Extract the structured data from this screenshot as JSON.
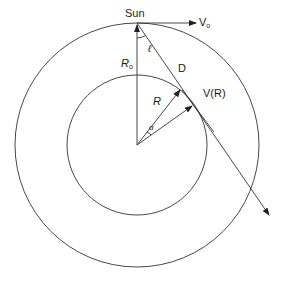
{
  "diagram": {
    "labels": {
      "sun": "Sun",
      "v0_main": "V",
      "v0_sub": "o",
      "r0_main": "R",
      "r0_sub": "o",
      "ell": "ℓ",
      "d": "D",
      "r": "R",
      "vr": "V(R)",
      "alpha": "α"
    },
    "geometry": {
      "center": [
        137,
        145
      ],
      "outer_radius": 122,
      "inner_radius": 70,
      "sun": [
        137,
        23
      ],
      "v0_tip": [
        196,
        23
      ],
      "line_of_sight_end": [
        269,
        215
      ],
      "r_vector_tip": [
        180,
        90
      ],
      "v_vector_tip": [
        192,
        106
      ]
    },
    "colors": {
      "line": "#333333",
      "text": "#1a1a1a",
      "background": "#ffffff"
    }
  }
}
